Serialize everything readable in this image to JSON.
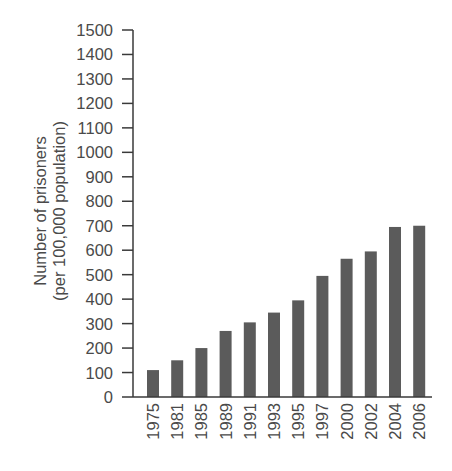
{
  "chart_data": {
    "type": "bar",
    "title": "",
    "xlabel": "",
    "ylabel": "Number of prisoners",
    "ylabel_line2": "(per 100,000 population)",
    "categories": [
      "1975",
      "1981",
      "1985",
      "1989",
      "1991",
      "1993",
      "1995",
      "1997",
      "2000",
      "2002",
      "2004",
      "2006"
    ],
    "values": [
      110,
      150,
      200,
      270,
      305,
      345,
      395,
      495,
      565,
      595,
      695,
      700
    ],
    "ylim": [
      0,
      1500
    ],
    "yticks": [
      0,
      100,
      200,
      300,
      400,
      500,
      600,
      700,
      800,
      900,
      1000,
      1100,
      1200,
      1300,
      1400,
      1500
    ],
    "grid": false,
    "legend": null,
    "x_tick_rotation": -90
  },
  "colors": {
    "bar": "#5b5b5b",
    "axis": "#3a3a3a",
    "text": "#4a4a4a"
  }
}
